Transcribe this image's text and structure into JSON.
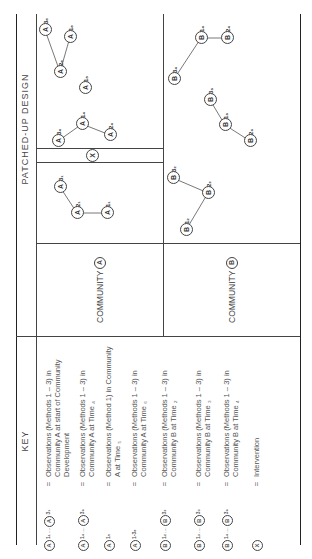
{
  "headers": {
    "key": "KEY",
    "design": "PATCHED-UP DESIGN"
  },
  "communities": [
    {
      "label": "COMMUNITY",
      "letter": "A"
    },
    {
      "label": "COMMUNITY",
      "letter": "B"
    }
  ],
  "key": [
    {
      "symbol": "A",
      "from_sub": "1₁",
      "to_sub": "3₁",
      "range": true,
      "desc": "Observations (Methods 1 – 3) in Community A at start of Community Development"
    },
    {
      "symbol": "A",
      "from_sub": "1₄",
      "to_sub": "3₄",
      "range": true,
      "desc": "Observations (Methods 1 – 3) in Community A at Time ₄"
    },
    {
      "symbol": "A",
      "from_sub": "1₅",
      "range": false,
      "desc": "Observations (Method 1) in Community A at Time ₅"
    },
    {
      "symbol": "A",
      "from_sub": "1-3₆",
      "range": false,
      "desc": "Observations (Methods 1 – 3) in Community A at Time ₆"
    },
    {
      "symbol": "B",
      "from_sub": "1₂",
      "to_sub": "3₂",
      "range": true,
      "desc": "Observations (Methods 1 – 3) in Community B at Time ₂"
    },
    {
      "symbol": "B",
      "from_sub": "1₃",
      "to_sub": "3₃",
      "range": true,
      "desc": "Observations (Methods 1 – 3) in Community B at Time ₃"
    },
    {
      "symbol": "B",
      "from_sub": "1₄",
      "to_sub": "3₄",
      "range": true,
      "desc": "Observations (Methods 1 – 3) in Community B at Time ₄"
    },
    {
      "symbol": "X",
      "range": false,
      "desc": "Intervention"
    }
  ],
  "equals": "=",
  "ellipsis": "....",
  "nodes": [
    {
      "id": "A1_1",
      "letter": "A",
      "sub": "1₁",
      "x": 346,
      "y": 107
    },
    {
      "id": "A2_1",
      "letter": "A",
      "sub": "2₁",
      "x": 346,
      "y": 77
    },
    {
      "id": "A3_1",
      "letter": "A",
      "sub": "3₁",
      "x": 372,
      "y": 60
    },
    {
      "id": "X",
      "letter": "X",
      "sub": "",
      "x": 403,
      "y": 92
    },
    {
      "id": "A3_4",
      "letter": "A",
      "sub": "3₄",
      "x": 418,
      "y": 58
    },
    {
      "id": "A1_4",
      "letter": "A",
      "sub": "1₄",
      "x": 435,
      "y": 82
    },
    {
      "id": "A2_4",
      "letter": "A",
      "sub": "2₄",
      "x": 424,
      "y": 110
    },
    {
      "id": "A1_5",
      "letter": "A",
      "sub": "1₅",
      "x": 471,
      "y": 85
    },
    {
      "id": "A2_6",
      "letter": "A",
      "sub": "2₆",
      "x": 487,
      "y": 60
    },
    {
      "id": "A3_6",
      "letter": "A",
      "sub": "3₆",
      "x": 529,
      "y": 45
    },
    {
      "id": "A1_6",
      "letter": "A",
      "sub": "1₆",
      "x": 522,
      "y": 70
    },
    {
      "id": "B1_2",
      "letter": "B",
      "sub": "1₂",
      "x": 329,
      "y": 186
    },
    {
      "id": "B2_2",
      "letter": "B",
      "sub": "2₂",
      "x": 366,
      "y": 208
    },
    {
      "id": "B3_2",
      "letter": "B",
      "sub": "3₂",
      "x": 381,
      "y": 173
    },
    {
      "id": "B2_3",
      "letter": "B",
      "sub": "2₃",
      "x": 418,
      "y": 250
    },
    {
      "id": "B1_3",
      "letter": "B",
      "sub": "1₃",
      "x": 434,
      "y": 225
    },
    {
      "id": "B3_3",
      "letter": "B",
      "sub": "3₃",
      "x": 459,
      "y": 210
    },
    {
      "id": "B3_4",
      "letter": "B",
      "sub": "3₄",
      "x": 480,
      "y": 174
    },
    {
      "id": "B1_4",
      "letter": "B",
      "sub": "1₄",
      "x": 521,
      "y": 201
    },
    {
      "id": "B2_4",
      "letter": "B",
      "sub": "2₄",
      "x": 521,
      "y": 227
    }
  ],
  "edges": [
    [
      "A1_1",
      "A2_1"
    ],
    [
      "A2_1",
      "A3_1"
    ],
    [
      "A3_4",
      "A1_4"
    ],
    [
      "A1_4",
      "A2_4"
    ],
    [
      "A2_6",
      "A3_6"
    ],
    [
      "A2_6",
      "A1_6"
    ],
    [
      "B1_2",
      "B2_2"
    ],
    [
      "B2_2",
      "B3_2"
    ],
    [
      "B3_3",
      "B1_3"
    ],
    [
      "B1_3",
      "B2_3"
    ],
    [
      "B3_4",
      "B1_4"
    ],
    [
      "B1_4",
      "B2_4"
    ]
  ]
}
